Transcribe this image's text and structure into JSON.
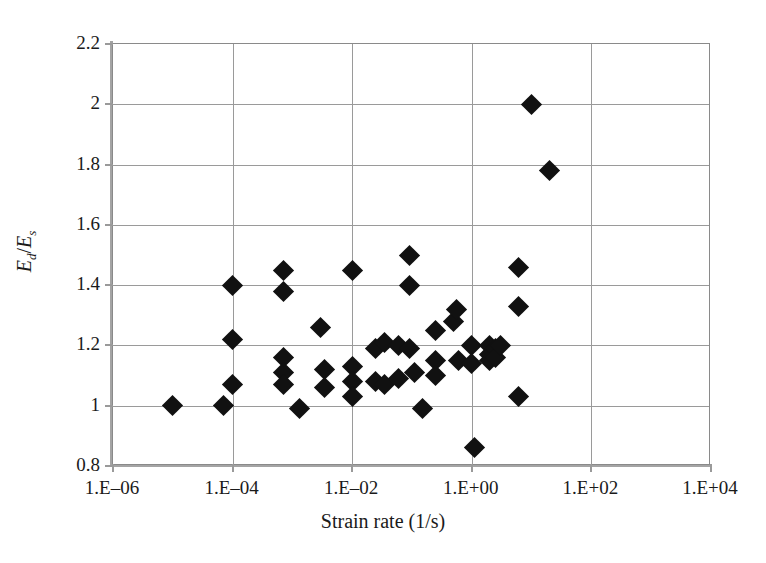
{
  "chart_data": {
    "type": "scatter",
    "title": "",
    "xlabel": "Strain rate (1/s)",
    "ylabel": "Ed/Es",
    "ylabel_parts": {
      "num": "E",
      "num_sub": "d",
      "slash": "/",
      "den": "E",
      "den_sub": "s"
    },
    "xscale": "log",
    "yscale": "linear",
    "xlim": [
      1e-06,
      10000.0
    ],
    "ylim": [
      0.8,
      2.2
    ],
    "grid": true,
    "legend": "none",
    "marker": "filled-diamond",
    "marker_color": "#111111",
    "xticks": [
      1e-06,
      0.0001,
      0.01,
      1,
      100,
      10000
    ],
    "xtick_labels": [
      "1.E–06",
      "1.E–04",
      "1.E–02",
      "1.E+00",
      "1.E+02",
      "1.E+04"
    ],
    "yticks": [
      0.8,
      1.0,
      1.2,
      1.4,
      1.6,
      1.8,
      2.0,
      2.2
    ],
    "ytick_labels": [
      "0.8",
      "1",
      "1.2",
      "1.4",
      "1.6",
      "1.8",
      "2",
      "2.2"
    ],
    "points": [
      {
        "x": 1e-05,
        "y": 1.0
      },
      {
        "x": 7e-05,
        "y": 1.0
      },
      {
        "x": 0.0001,
        "y": 1.4
      },
      {
        "x": 0.0001,
        "y": 1.22
      },
      {
        "x": 0.0001,
        "y": 1.07
      },
      {
        "x": 0.0007,
        "y": 1.45
      },
      {
        "x": 0.0007,
        "y": 1.38
      },
      {
        "x": 0.0007,
        "y": 1.16
      },
      {
        "x": 0.0007,
        "y": 1.11
      },
      {
        "x": 0.0007,
        "y": 1.07
      },
      {
        "x": 0.0013,
        "y": 0.99
      },
      {
        "x": 0.003,
        "y": 1.26
      },
      {
        "x": 0.0035,
        "y": 1.12
      },
      {
        "x": 0.0035,
        "y": 1.06
      },
      {
        "x": 0.01,
        "y": 1.45
      },
      {
        "x": 0.01,
        "y": 1.13
      },
      {
        "x": 0.01,
        "y": 1.08
      },
      {
        "x": 0.01,
        "y": 1.03
      },
      {
        "x": 0.025,
        "y": 1.19
      },
      {
        "x": 0.025,
        "y": 1.08
      },
      {
        "x": 0.035,
        "y": 1.21
      },
      {
        "x": 0.035,
        "y": 1.07
      },
      {
        "x": 0.06,
        "y": 1.2
      },
      {
        "x": 0.06,
        "y": 1.09
      },
      {
        "x": 0.09,
        "y": 1.5
      },
      {
        "x": 0.09,
        "y": 1.4
      },
      {
        "x": 0.09,
        "y": 1.19
      },
      {
        "x": 0.11,
        "y": 1.11
      },
      {
        "x": 0.15,
        "y": 0.99
      },
      {
        "x": 0.25,
        "y": 1.25
      },
      {
        "x": 0.25,
        "y": 1.15
      },
      {
        "x": 0.25,
        "y": 1.1
      },
      {
        "x": 0.5,
        "y": 1.28
      },
      {
        "x": 0.55,
        "y": 1.32
      },
      {
        "x": 0.6,
        "y": 1.15
      },
      {
        "x": 1.0,
        "y": 1.2
      },
      {
        "x": 1.0,
        "y": 1.14
      },
      {
        "x": 1.1,
        "y": 0.86
      },
      {
        "x": 2.0,
        "y": 1.2
      },
      {
        "x": 2.0,
        "y": 1.17
      },
      {
        "x": 2.0,
        "y": 1.15
      },
      {
        "x": 2.5,
        "y": 1.19
      },
      {
        "x": 2.5,
        "y": 1.16
      },
      {
        "x": 3.0,
        "y": 1.2
      },
      {
        "x": 6.0,
        "y": 1.46
      },
      {
        "x": 6.0,
        "y": 1.33
      },
      {
        "x": 6.0,
        "y": 1.03
      },
      {
        "x": 10.0,
        "y": 2.0
      },
      {
        "x": 20.0,
        "y": 1.78
      }
    ]
  }
}
